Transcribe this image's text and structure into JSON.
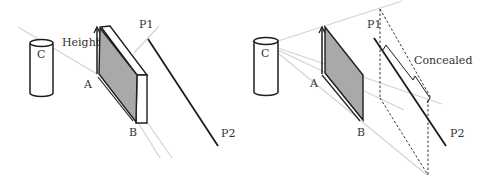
{
  "colors": {
    "ink": "#1e1e1e",
    "ray": "#d4d4d4",
    "face": "#a9a9a9",
    "label": "#333333"
  },
  "left_panel": {
    "labels": {
      "camera": "C",
      "height": "Height",
      "point_a": "A",
      "point_b": "B",
      "p1": "P1",
      "p2": "P2"
    }
  },
  "right_panel": {
    "labels": {
      "camera": "C",
      "point_a": "A",
      "point_b": "B",
      "p1": "P1",
      "p2": "P2",
      "concealed": "Concealed"
    }
  }
}
